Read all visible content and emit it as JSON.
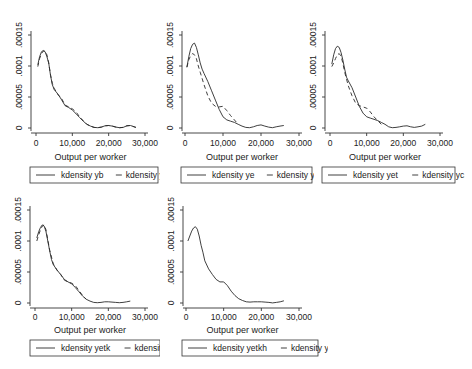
{
  "chart_data": [
    {
      "type": "line",
      "title": "",
      "xlabel": "Output per worker",
      "ylabel": "",
      "xlim": [
        0,
        30000
      ],
      "ylim": [
        0,
        0.00015
      ],
      "xticks": [
        "0",
        "10,000",
        "20,000",
        "30,000"
      ],
      "yticks": [
        "0",
        ".00005",
        ".0001",
        ".00015"
      ],
      "grid": false,
      "legend_position": "bottom",
      "series": [
        {
          "name": "kdensity yb",
          "style": "solid",
          "x": [
            500,
            1000,
            1500,
            2000,
            2500,
            3000,
            3500,
            4000,
            4500,
            5000,
            6000,
            7000,
            8000,
            9000,
            10000,
            11000,
            12000,
            13000,
            14000,
            15000,
            16000,
            17000,
            18000,
            19000,
            20000,
            21000,
            22000,
            23000,
            24000,
            25000,
            26000,
            27000,
            27500
          ],
          "values": [
            0.000102,
            0.000115,
            0.000123,
            0.000125,
            0.000123,
            0.000115,
            0.000105,
            8.5e-05,
            7e-05,
            6.2e-05,
            5.5e-05,
            4.6e-05,
            3.6e-05,
            3.3e-05,
            2.9e-05,
            2.3e-05,
            1.7e-05,
            1.1e-05,
            6e-06,
            3e-06,
            1e-06,
            5e-07,
            1.5e-06,
            3.5e-06,
            4e-06,
            3e-06,
            1.5e-06,
            5e-07,
            1e-06,
            3.5e-06,
            4e-06,
            2e-06,
            1e-06
          ]
        },
        {
          "name": "kdensity yc",
          "style": "dashed",
          "x": [
            500,
            1000,
            1500,
            2000,
            2500,
            3000,
            3500,
            4000,
            4500,
            5000,
            6000,
            7000,
            8000,
            9000,
            10000,
            11000,
            12000,
            13000,
            14000,
            15000,
            16000,
            17000,
            18000,
            19000,
            20000,
            21000,
            22000,
            23000,
            24000,
            25000,
            26000,
            27000,
            27500
          ],
          "values": [
            9.9e-05,
            0.000112,
            0.00012,
            0.000124,
            0.000124,
            0.000118,
            0.000105,
            8.6e-05,
            7.2e-05,
            6.4e-05,
            5.4e-05,
            4.8e-05,
            3.7e-05,
            3.4e-05,
            3.1e-05,
            2.6e-05,
            1.8e-05,
            1.2e-05,
            6e-06,
            3e-06,
            1e-06,
            5e-07,
            1.5e-06,
            3.5e-06,
            4e-06,
            3e-06,
            1.5e-06,
            5e-07,
            1e-06,
            3.5e-06,
            4e-06,
            2e-06,
            1e-06
          ]
        }
      ]
    },
    {
      "type": "line",
      "title": "",
      "xlabel": "Output per worker",
      "ylabel": "",
      "xlim": [
        0,
        30000
      ],
      "ylim": [
        0,
        0.00015
      ],
      "xticks": [
        "0",
        "10,000",
        "20,000",
        "30,000"
      ],
      "yticks": [
        "0",
        ".00005",
        ".0001",
        ".00015"
      ],
      "grid": false,
      "legend_position": "bottom",
      "series": [
        {
          "name": "kdensity ye",
          "style": "solid",
          "x": [
            500,
            1000,
            1500,
            2000,
            2500,
            3000,
            3500,
            4000,
            4500,
            5000,
            6000,
            7000,
            8000,
            9000,
            10000,
            11000,
            12000,
            13000,
            14000,
            15000,
            16000,
            17000,
            18000,
            19000,
            20000,
            21000,
            22000,
            23000,
            24000,
            25000,
            26000
          ],
          "values": [
            9.8e-05,
            0.000115,
            0.000128,
            0.000135,
            0.000137,
            0.00013,
            0.000118,
            0.000105,
            9.5e-05,
            8.8e-05,
            7.5e-05,
            6e-05,
            4.5e-05,
            3e-05,
            1.8e-05,
            1.3e-05,
            1.1e-05,
            9e-06,
            6e-06,
            3e-06,
            1e-06,
            5e-07,
            2e-06,
            4e-06,
            5e-06,
            3e-06,
            1.5e-06,
            5e-07,
            2e-06,
            3e-06,
            4e-06
          ]
        },
        {
          "name": "kdensity yc",
          "style": "dashed",
          "x": [
            500,
            1000,
            1500,
            2000,
            2500,
            3000,
            3500,
            4000,
            5000,
            6000,
            7000,
            8000,
            9000,
            10000,
            11000,
            12000,
            13000,
            14000
          ],
          "values": [
            9.8e-05,
            0.00011,
            0.000117,
            0.00012,
            0.000118,
            0.000112,
            0.0001,
            9e-05,
            7e-05,
            5.2e-05,
            4e-05,
            3.5e-05,
            3.4e-05,
            3.5e-05,
            2.8e-05,
            2e-05,
            1.3e-05,
            6e-06
          ]
        }
      ]
    },
    {
      "type": "line",
      "title": "",
      "xlabel": "Output per worker",
      "ylabel": "",
      "xlim": [
        0,
        30000
      ],
      "ylim": [
        0,
        0.00015
      ],
      "xticks": [
        "0",
        "10,000",
        "20,000",
        "30,000"
      ],
      "yticks": [
        "0",
        ".00005",
        ".0001",
        ".00015"
      ],
      "grid": false,
      "legend_position": "bottom",
      "series": [
        {
          "name": "kdensity yet",
          "style": "solid",
          "x": [
            500,
            1000,
            1500,
            2000,
            2500,
            3000,
            3500,
            4000,
            4500,
            5000,
            6000,
            7000,
            8000,
            9000,
            10000,
            11000,
            12000,
            13000,
            14000,
            15000,
            16000,
            17000,
            18000,
            19000,
            20000,
            21000,
            22000,
            23000,
            24000,
            25000,
            26000
          ],
          "values": [
            0.000103,
            0.000118,
            0.000128,
            0.000132,
            0.00013,
            0.000122,
            0.00011,
            9.5e-05,
            8.2e-05,
            7.6e-05,
            6.5e-05,
            5e-05,
            3.5e-05,
            2.4e-05,
            1.8e-05,
            1.6e-05,
            1.4e-05,
            1.2e-05,
            9e-06,
            6e-06,
            2e-06,
            5e-07,
            1e-06,
            2e-06,
            3e-06,
            3.5e-06,
            2e-06,
            1e-06,
            2e-06,
            3e-06,
            6e-06
          ]
        },
        {
          "name": "kdensity yc",
          "style": "dashed",
          "x": [
            500,
            1000,
            1500,
            2000,
            2500,
            3000,
            3500,
            4000,
            5000,
            6000,
            7000,
            8000,
            9000,
            10000,
            11000,
            12000,
            13000,
            14000
          ],
          "values": [
            9.9e-05,
            0.000105,
            0.000112,
            0.000118,
            0.00012,
            0.000116,
            0.000105,
            9e-05,
            6.8e-05,
            5.2e-05,
            4e-05,
            3.6e-05,
            3.4e-05,
            3.2e-05,
            2.6e-05,
            1.8e-05,
            1.2e-05,
            6e-06
          ]
        }
      ]
    },
    {
      "type": "line",
      "title": "",
      "xlabel": "Output per worker",
      "ylabel": "",
      "xlim": [
        0,
        30000
      ],
      "ylim": [
        0,
        0.00015
      ],
      "xticks": [
        "0",
        "10,000",
        "20,000",
        "30,000"
      ],
      "yticks": [
        "0",
        ".00005",
        ".0001",
        ".00015"
      ],
      "grid": false,
      "legend_position": "bottom",
      "series": [
        {
          "name": "kdensity yetk",
          "style": "solid",
          "x": [
            500,
            1000,
            1500,
            2000,
            2500,
            3000,
            3500,
            4000,
            4500,
            5000,
            6000,
            7000,
            8000,
            9000,
            10000,
            11000,
            12000,
            13000,
            14000,
            15000,
            16000,
            17000,
            18000,
            19000,
            20000,
            21000,
            22000,
            23000,
            24000,
            25000,
            26000
          ],
          "values": [
            0.000105,
            0.000115,
            0.000122,
            0.000126,
            0.000124,
            0.000115,
            0.0001,
            8.4e-05,
            7e-05,
            6.2e-05,
            5.3e-05,
            4.6e-05,
            3.8e-05,
            3.4e-05,
            3.1e-05,
            2.5e-05,
            1.8e-05,
            1.1e-05,
            6e-06,
            3e-06,
            1e-06,
            5e-07,
            1e-06,
            2e-06,
            2e-06,
            1.5e-06,
            1e-06,
            5e-07,
            1e-06,
            2e-06,
            3e-06
          ]
        },
        {
          "name": "kdensity yc",
          "style": "dashed",
          "x": [
            500,
            1000,
            1500,
            2000,
            2500,
            3000,
            3500,
            4000,
            5000,
            6000,
            7000,
            8000,
            9000,
            10000,
            11000,
            12000,
            13000,
            14000
          ],
          "values": [
            0.0001,
            0.00011,
            0.000118,
            0.000124,
            0.000126,
            0.000118,
            0.000102,
            8.5e-05,
            6.3e-05,
            5.3e-05,
            4.6e-05,
            3.7e-05,
            3.4e-05,
            3.2e-05,
            2.8e-05,
            2e-05,
            1.2e-05,
            6e-06
          ]
        }
      ]
    },
    {
      "type": "line",
      "title": "",
      "xlabel": "Output per worker",
      "ylabel": "",
      "xlim": [
        0,
        30000
      ],
      "ylim": [
        0,
        0.00015
      ],
      "xticks": [
        "0",
        "10,000",
        "20,000",
        "30,000"
      ],
      "yticks": [
        "0",
        ".00005",
        ".0001",
        ".00015"
      ],
      "grid": false,
      "legend_position": "bottom",
      "series": [
        {
          "name": "kdensity yetkh",
          "style": "solid",
          "x": [
            500,
            1000,
            1500,
            2000,
            2500,
            3000,
            3500,
            4000,
            4500,
            5000,
            6000,
            7000,
            8000,
            9000,
            10000,
            11000,
            12000,
            13000,
            14000,
            15000,
            16000,
            17000,
            18000,
            19000,
            20000,
            21000,
            22000,
            23000,
            24000,
            25000,
            26000
          ],
          "values": [
            0.0001,
            0.000108,
            0.000116,
            0.000121,
            0.000123,
            0.000119,
            0.000108,
            9.3e-05,
            8.2e-05,
            6.8e-05,
            5.5e-05,
            4.6e-05,
            3.8e-05,
            3.4e-05,
            3.4e-05,
            2.8e-05,
            1.9e-05,
            1.2e-05,
            7e-06,
            4e-06,
            2e-06,
            1.5e-06,
            2e-06,
            2e-06,
            2e-06,
            1.5e-06,
            1e-06,
            2e-07,
            1e-06,
            2e-06,
            3.5e-06
          ]
        },
        {
          "name": "kdensity yc",
          "style": "dashed",
          "x": [],
          "values": []
        }
      ]
    }
  ],
  "panels": [
    {
      "xlabel": "Output per worker",
      "legend": [
        "kdensity yb",
        "kdensity yc"
      ]
    },
    {
      "xlabel": "Output per worker",
      "legend": [
        "kdensity ye",
        "kdensity yc"
      ]
    },
    {
      "xlabel": "Output per worker",
      "legend": [
        "kdensity yet",
        "kdensity yc"
      ]
    },
    {
      "xlabel": "Output per worker",
      "legend": [
        "kdensity yetk",
        "kdensity yc"
      ]
    },
    {
      "xlabel": "Output per worker",
      "legend": [
        "kdensity yetkh",
        "kdensity yc"
      ]
    }
  ],
  "colors": {
    "line": "#2a2a2a",
    "axis": "#333333",
    "background": "#ffffff"
  }
}
